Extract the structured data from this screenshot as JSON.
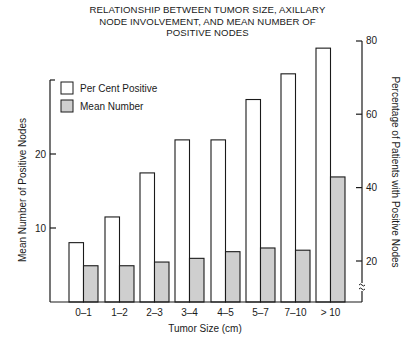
{
  "chart_data": {
    "type": "bar",
    "title": "RELATIONSHIP BETWEEN TUMOR SIZE, AXILLARY NODE INVOLVEMENT, AND MEAN NUMBER OF POSITIVE NODES",
    "title_lines": [
      "RELATIONSHIP BETWEEN TUMOR SIZE, AXILLARY",
      "NODE INVOLVEMENT, AND MEAN NUMBER OF",
      "POSITIVE NODES"
    ],
    "xlabel": "Tumor Size (cm)",
    "ylabel_left": "Mean Number of Positive Nodes",
    "ylabel_right": "Percentage of Patients with Positive Nodes",
    "categories": [
      "0–1",
      "1–2",
      "2–3",
      "3–4",
      "4–5",
      "5–7",
      "7–10",
      "> 10"
    ],
    "series": [
      {
        "name": "Per Cent Positive",
        "axis": "right",
        "fill": "#ffffff",
        "values": [
          25,
          32,
          44,
          53,
          53,
          64,
          71,
          78
        ]
      },
      {
        "name": "Mean Number",
        "axis": "left",
        "fill": "#cfcfcf",
        "values": [
          4.9,
          4.9,
          5.4,
          5.9,
          6.8,
          7.3,
          7.0,
          16.9
        ]
      }
    ],
    "left_axis": {
      "ticks": [
        10,
        20
      ],
      "ylim": [
        0,
        30
      ]
    },
    "right_axis": {
      "ticks": [
        20,
        40,
        60,
        80
      ],
      "ylim": [
        9,
        80
      ],
      "axis_break": true
    },
    "legend": {
      "position": "upper-left",
      "entries": [
        "Per Cent Positive",
        "Mean Number"
      ]
    },
    "grid": false
  },
  "colors": {
    "ink": "#1a1a1a",
    "mean_fill": "#cfcfcf",
    "percent_fill": "#ffffff"
  }
}
